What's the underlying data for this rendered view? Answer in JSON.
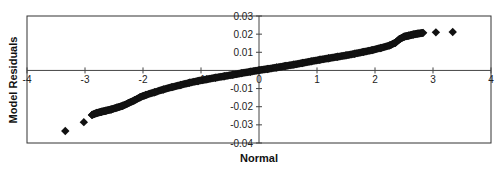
{
  "chart_data": {
    "type": "scatter",
    "title": "",
    "xlabel": "Normal",
    "ylabel": "Model Residuals",
    "xlim": [
      -4,
      4
    ],
    "ylim": [
      -0.04,
      0.03
    ],
    "x_ticks": [
      -4,
      -3,
      -2,
      -1,
      0,
      1,
      2,
      3,
      4
    ],
    "x_tick_labels": [
      "-4",
      "-3",
      "-2",
      "-1",
      "0",
      "1",
      "2",
      "3",
      "4"
    ],
    "y_ticks": [
      0.03,
      0.02,
      0.01,
      0,
      -0.01,
      -0.02,
      -0.03,
      -0.04
    ],
    "y_tick_labels": [
      "0.03",
      "0.02",
      "0.01",
      "",
      "-0.01",
      "-0.02",
      "-0.03",
      "-0.04"
    ],
    "grid": false,
    "legend": null,
    "marker": "diamond",
    "marker_color": "#111111",
    "series": [
      {
        "name": "Model Residuals",
        "points": [
          {
            "x": -3.34,
            "y": -0.0334
          },
          {
            "x": -3.02,
            "y": -0.0285
          },
          {
            "x": -2.88,
            "y": -0.0245
          },
          {
            "x": -2.8,
            "y": -0.0235
          },
          {
            "x": -2.72,
            "y": -0.0228
          },
          {
            "x": -2.64,
            "y": -0.0222
          },
          {
            "x": -2.55,
            "y": -0.0215
          },
          {
            "x": -2.45,
            "y": -0.0205
          },
          {
            "x": -2.35,
            "y": -0.0195
          },
          {
            "x": -2.25,
            "y": -0.018
          },
          {
            "x": -2.15,
            "y": -0.0165
          },
          {
            "x": -2.05,
            "y": -0.0148
          },
          {
            "x": -1.95,
            "y": -0.0135
          },
          {
            "x": -1.8,
            "y": -0.012
          },
          {
            "x": -1.65,
            "y": -0.0105
          },
          {
            "x": -1.5,
            "y": -0.0092
          },
          {
            "x": -1.35,
            "y": -0.008
          },
          {
            "x": -1.2,
            "y": -0.0068
          },
          {
            "x": -1.05,
            "y": -0.0058
          },
          {
            "x": -0.9,
            "y": -0.0049
          },
          {
            "x": -0.75,
            "y": -0.004
          },
          {
            "x": -0.6,
            "y": -0.0032
          },
          {
            "x": -0.45,
            "y": -0.0024
          },
          {
            "x": -0.3,
            "y": -0.0015
          },
          {
            "x": -0.15,
            "y": -0.0007
          },
          {
            "x": 0.0,
            "y": 0.0001
          },
          {
            "x": 0.15,
            "y": 0.0008
          },
          {
            "x": 0.3,
            "y": 0.0016
          },
          {
            "x": 0.45,
            "y": 0.0024
          },
          {
            "x": 0.6,
            "y": 0.0032
          },
          {
            "x": 0.75,
            "y": 0.0041
          },
          {
            "x": 0.9,
            "y": 0.005
          },
          {
            "x": 1.05,
            "y": 0.0059
          },
          {
            "x": 1.2,
            "y": 0.0067
          },
          {
            "x": 1.35,
            "y": 0.0075
          },
          {
            "x": 1.5,
            "y": 0.0083
          },
          {
            "x": 1.65,
            "y": 0.0092
          },
          {
            "x": 1.8,
            "y": 0.0102
          },
          {
            "x": 1.95,
            "y": 0.0112
          },
          {
            "x": 2.1,
            "y": 0.0124
          },
          {
            "x": 2.25,
            "y": 0.0138
          },
          {
            "x": 2.35,
            "y": 0.0152
          },
          {
            "x": 2.42,
            "y": 0.0172
          },
          {
            "x": 2.5,
            "y": 0.0186
          },
          {
            "x": 2.58,
            "y": 0.0192
          },
          {
            "x": 2.66,
            "y": 0.0198
          },
          {
            "x": 2.74,
            "y": 0.0203
          },
          {
            "x": 2.83,
            "y": 0.0207
          },
          {
            "x": 3.05,
            "y": 0.021
          },
          {
            "x": 3.34,
            "y": 0.0212
          }
        ]
      }
    ]
  }
}
